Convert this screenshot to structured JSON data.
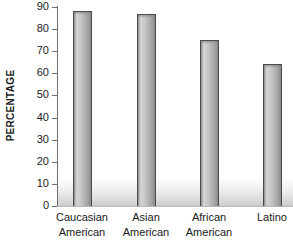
{
  "chart_data": {
    "type": "bar",
    "title": "",
    "xlabel": "",
    "ylabel": "PERCENTAGE",
    "categories": [
      "Caucasian American",
      "Asian American",
      "African American",
      "Latino"
    ],
    "category_lines": [
      [
        "Caucasian",
        "American"
      ],
      [
        "Asian",
        "American"
      ],
      [
        "African",
        "American"
      ],
      [
        "Latino",
        ""
      ]
    ],
    "values": [
      88,
      87,
      75,
      64
    ],
    "ylim": [
      0,
      90
    ],
    "ytick_step": 10,
    "yticks": [
      90,
      80,
      70,
      60,
      50,
      40,
      30,
      20,
      10,
      0
    ],
    "ytick_labels": [
      "90",
      "80",
      "70",
      "60",
      "50",
      "40",
      "30",
      "20",
      "10",
      "0"
    ],
    "grid": false,
    "legend": null,
    "legend_position": "none",
    "bar_fill_color": "#b8b8b8",
    "bar_border_color": "#4a4a4a",
    "axis_color": "#6e6e6e",
    "text_color": "#1a1a1a",
    "background_color": "#ffffff"
  }
}
